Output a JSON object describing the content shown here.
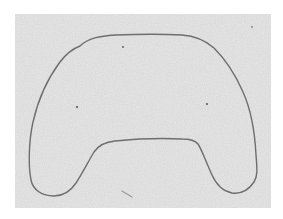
{
  "canvas": {
    "width": 283,
    "height": 219,
    "background": "#ffffff"
  },
  "paper": {
    "x": 15,
    "y": 14,
    "width": 256,
    "height": 194,
    "color": "#e4e4e4",
    "texture_color": "#d2d2d2"
  },
  "outline": {
    "description": "hand-drawn closed contour shaped like a game controller / arch with two lobes",
    "stroke": "#6e6e6e",
    "stroke_width": 1.4,
    "path": "M 80 46 C 88 38, 100 36, 115 35 C 140 34, 165 34, 182 35 C 196 36, 206 41, 214 48 C 226 60, 236 76, 243 92 C 252 112, 255 135, 256 155 C 257 168, 258 176, 254 182 C 248 191, 240 194, 232 193 C 222 191, 216 184, 212 175 C 206 162, 202 150, 198 144 C 195 140, 190 139, 182 139 C 160 138, 135 139, 115 141 C 104 142, 98 146, 94 152 C 88 162, 82 174, 76 183 C 70 192, 62 196, 54 196 C 42 196, 33 190, 31 180 C 28 165, 29 140, 33 122 C 38 100, 48 78, 60 62 C 66 54, 72 49, 80 46 Z"
  },
  "specks": [
    {
      "name": "speck-upper",
      "cx": 123,
      "cy": 47,
      "r": 0.9
    },
    {
      "name": "speck-left",
      "cx": 77,
      "cy": 107,
      "r": 1.1
    },
    {
      "name": "speck-right",
      "cx": 207,
      "cy": 104,
      "r": 1.0
    },
    {
      "name": "speck-top-right",
      "cx": 252,
      "cy": 27,
      "r": 0.8
    }
  ],
  "streak": {
    "x1": 122,
    "y1": 191,
    "x2": 132,
    "y2": 197,
    "color": "#9a9a9a"
  }
}
